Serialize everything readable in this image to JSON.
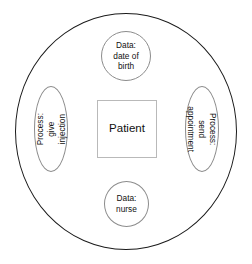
{
  "diagram": {
    "type": "concept-circle-diagram",
    "outer_boundary": {
      "name": "system-boundary",
      "label": ""
    },
    "center": {
      "shape": "rectangle",
      "label": "Patient"
    },
    "nodes": [
      {
        "id": "data-date-of-birth",
        "shape": "circle",
        "position": "top",
        "label": "Data:\ndate of\nbirth"
      },
      {
        "id": "process-send-appointment",
        "shape": "ellipse",
        "position": "right",
        "rotation": 90,
        "label": "Process: send\nappointment"
      },
      {
        "id": "data-nurse",
        "shape": "circle",
        "position": "bottom",
        "label": "Data:\nnurse"
      },
      {
        "id": "process-give-injection",
        "shape": "ellipse",
        "position": "left",
        "rotation": -90,
        "label": "Process: give\ninjection"
      }
    ],
    "colors": {
      "background": "#ffffff",
      "outer_stroke": "#1a1a1a",
      "node_stroke": "#8c8c8c",
      "box_stroke": "#b9b9b9",
      "text": "#111111"
    }
  }
}
